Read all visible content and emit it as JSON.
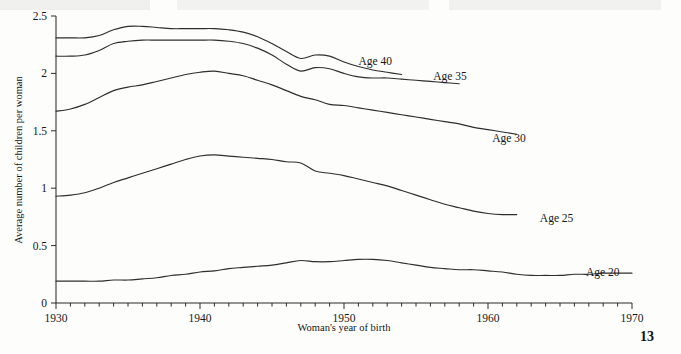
{
  "page": {
    "page_number": "13",
    "background_color": "#fdfdfc",
    "ink_color": "#2e2e2e"
  },
  "chart_data": {
    "type": "line",
    "title": "",
    "subtitle": "",
    "xlabel": "Woman's year of birth",
    "ylabel": "Average number of children per woman",
    "xlim": [
      1930,
      1970
    ],
    "ylim": [
      0,
      2.5
    ],
    "grid": false,
    "legend_position": "inline-right-of-line-end",
    "xticks": [
      1930,
      1940,
      1950,
      1960,
      1970
    ],
    "xtick_labels": [
      "1930",
      "1940",
      "1950",
      "1960",
      "1970"
    ],
    "x_minor_tick_interval": 1,
    "yticks": [
      0,
      0.5,
      1,
      1.5,
      2,
      2.5
    ],
    "ytick_labels": [
      "0",
      "0.5",
      "1",
      "1.5",
      "2",
      "2.5"
    ],
    "series": [
      {
        "name": "Age 40",
        "label": "Age 40",
        "label_x": 1951.0,
        "label_y": 2.11,
        "x": [
          1930,
          1931,
          1932,
          1933,
          1934,
          1935,
          1936,
          1937,
          1938,
          1939,
          1940,
          1941,
          1942,
          1943,
          1944,
          1945,
          1946,
          1947,
          1948,
          1949,
          1950,
          1951,
          1952,
          1953,
          1954
        ],
        "values": [
          2.31,
          2.31,
          2.31,
          2.33,
          2.38,
          2.41,
          2.41,
          2.4,
          2.39,
          2.39,
          2.39,
          2.39,
          2.38,
          2.36,
          2.32,
          2.26,
          2.19,
          2.13,
          2.16,
          2.15,
          2.1,
          2.06,
          2.03,
          2.01,
          1.99
        ]
      },
      {
        "name": "Age 35",
        "label": "Age 35",
        "label_x": 1956.2,
        "label_y": 1.98,
        "x": [
          1930,
          1931,
          1932,
          1933,
          1934,
          1935,
          1936,
          1937,
          1938,
          1939,
          1940,
          1941,
          1942,
          1943,
          1944,
          1945,
          1946,
          1947,
          1948,
          1949,
          1950,
          1951,
          1952,
          1953,
          1954,
          1955,
          1956,
          1957,
          1958
        ],
        "values": [
          2.15,
          2.15,
          2.16,
          2.2,
          2.26,
          2.28,
          2.29,
          2.29,
          2.29,
          2.29,
          2.29,
          2.29,
          2.28,
          2.26,
          2.22,
          2.16,
          2.08,
          2.02,
          2.05,
          2.04,
          2.0,
          1.97,
          1.96,
          1.96,
          1.95,
          1.94,
          1.93,
          1.92,
          1.91
        ]
      },
      {
        "name": "Age 30",
        "label": "Age 30",
        "label_x": 1960.3,
        "label_y": 1.44,
        "x": [
          1930,
          1931,
          1932,
          1933,
          1934,
          1935,
          1936,
          1937,
          1938,
          1939,
          1940,
          1941,
          1942,
          1943,
          1944,
          1945,
          1946,
          1947,
          1948,
          1949,
          1950,
          1951,
          1952,
          1953,
          1954,
          1955,
          1956,
          1957,
          1958,
          1959,
          1960,
          1961,
          1962
        ],
        "values": [
          1.67,
          1.69,
          1.73,
          1.79,
          1.85,
          1.88,
          1.9,
          1.93,
          1.96,
          1.99,
          2.01,
          2.02,
          2.0,
          1.98,
          1.94,
          1.9,
          1.85,
          1.8,
          1.77,
          1.73,
          1.72,
          1.7,
          1.68,
          1.66,
          1.64,
          1.62,
          1.6,
          1.58,
          1.56,
          1.53,
          1.51,
          1.49,
          1.47
        ]
      },
      {
        "name": "Age 25",
        "label": "Age 25",
        "label_x": 1963.6,
        "label_y": 0.74,
        "x": [
          1930,
          1931,
          1932,
          1933,
          1934,
          1935,
          1936,
          1937,
          1938,
          1939,
          1940,
          1941,
          1942,
          1943,
          1944,
          1945,
          1946,
          1947,
          1948,
          1949,
          1950,
          1951,
          1952,
          1953,
          1954,
          1955,
          1956,
          1957,
          1958,
          1959,
          1960,
          1961,
          1962
        ],
        "values": [
          0.93,
          0.94,
          0.96,
          1.0,
          1.05,
          1.09,
          1.13,
          1.17,
          1.21,
          1.25,
          1.28,
          1.29,
          1.28,
          1.27,
          1.26,
          1.25,
          1.23,
          1.22,
          1.15,
          1.13,
          1.11,
          1.08,
          1.05,
          1.02,
          0.98,
          0.94,
          0.9,
          0.86,
          0.83,
          0.8,
          0.78,
          0.77,
          0.77
        ]
      },
      {
        "name": "Age 20",
        "label": "Age 20",
        "label_x": 1966.8,
        "label_y": 0.27,
        "x": [
          1930,
          1931,
          1932,
          1933,
          1934,
          1935,
          1936,
          1937,
          1938,
          1939,
          1940,
          1941,
          1942,
          1943,
          1944,
          1945,
          1946,
          1947,
          1948,
          1949,
          1950,
          1951,
          1952,
          1953,
          1954,
          1955,
          1956,
          1957,
          1958,
          1959,
          1960,
          1961,
          1962,
          1963,
          1964,
          1965,
          1966,
          1967,
          1968,
          1969,
          1970
        ],
        "values": [
          0.19,
          0.19,
          0.19,
          0.19,
          0.2,
          0.2,
          0.21,
          0.22,
          0.24,
          0.25,
          0.27,
          0.28,
          0.3,
          0.31,
          0.32,
          0.33,
          0.35,
          0.37,
          0.36,
          0.36,
          0.37,
          0.38,
          0.38,
          0.37,
          0.35,
          0.33,
          0.31,
          0.3,
          0.29,
          0.29,
          0.28,
          0.27,
          0.25,
          0.24,
          0.24,
          0.24,
          0.25,
          0.25,
          0.26,
          0.26,
          0.26
        ]
      }
    ]
  }
}
